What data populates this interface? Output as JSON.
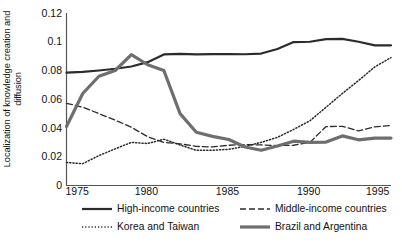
{
  "chart_data": {
    "type": "line",
    "title": "",
    "xlabel": "",
    "ylabel": "Localization of knowledge creation and diffusion",
    "xlim": [
      1975,
      1995
    ],
    "ylim": [
      0,
      0.12
    ],
    "grid": false,
    "legend_position": "bottom",
    "x": [
      1975,
      1976,
      1977,
      1978,
      1979,
      1980,
      1981,
      1982,
      1983,
      1984,
      1985,
      1986,
      1987,
      1988,
      1989,
      1990,
      1991,
      1992,
      1993,
      1994,
      1995
    ],
    "xticks": [
      "1975",
      "1980",
      "1985",
      "1990",
      "1995"
    ],
    "xtick_values": [
      1975,
      1980,
      1985,
      1990,
      1995
    ],
    "yticks": [
      "0",
      "0.02",
      "0.04",
      "0.06",
      "0.08",
      "0.1",
      "0.12"
    ],
    "ytick_values": [
      0,
      0.02,
      0.04,
      0.06,
      0.08,
      0.1,
      0.12
    ],
    "series": [
      {
        "name": "High-income countries",
        "style": "solid",
        "color": "#2b2b2b",
        "width": 2.2,
        "values": [
          0.0785,
          0.079,
          0.08,
          0.0812,
          0.0828,
          0.0858,
          0.0912,
          0.0915,
          0.0912,
          0.0914,
          0.0914,
          0.0913,
          0.0918,
          0.095,
          0.0998,
          0.1,
          0.1018,
          0.102,
          0.1,
          0.0975,
          0.0975
        ]
      },
      {
        "name": "Middle-income countries",
        "style": "dashed",
        "color": "#2b2b2b",
        "width": 1.3,
        "values": [
          0.0572,
          0.0545,
          0.05,
          0.0455,
          0.0405,
          0.034,
          0.03,
          0.029,
          0.0272,
          0.0268,
          0.028,
          0.0285,
          0.0282,
          0.0278,
          0.028,
          0.03,
          0.041,
          0.0412,
          0.038,
          0.0408,
          0.0418
        ]
      },
      {
        "name": "Korea and Taiwan",
        "style": "dotted",
        "color": "#2b2b2b",
        "width": 1.5,
        "values": [
          0.016,
          0.0152,
          0.0208,
          0.0255,
          0.03,
          0.0292,
          0.0322,
          0.0282,
          0.0245,
          0.0245,
          0.0252,
          0.0272,
          0.03,
          0.0335,
          0.039,
          0.045,
          0.0545,
          0.064,
          0.073,
          0.0825,
          0.089
        ]
      },
      {
        "name": "Brazil and Argentina",
        "style": "solid-thick",
        "color": "#6e6e6e",
        "width": 3.2,
        "values": [
          0.041,
          0.064,
          0.076,
          0.08,
          0.091,
          0.084,
          0.08,
          0.05,
          0.037,
          0.0342,
          0.032,
          0.0268,
          0.0245,
          0.0275,
          0.0308,
          0.03,
          0.0302,
          0.0345,
          0.0318,
          0.033,
          0.033
        ]
      }
    ]
  },
  "legend": {
    "items": [
      {
        "label": "High-income countries",
        "style": "solid"
      },
      {
        "label": "Middle-income countries",
        "style": "dashed"
      },
      {
        "label": "Korea and Taiwan",
        "style": "dotted"
      },
      {
        "label": "Brazil and Argentina",
        "style": "solid-thick"
      }
    ]
  }
}
